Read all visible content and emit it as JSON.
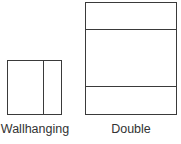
{
  "diagram": {
    "shapes": [
      {
        "id": "wallhanging",
        "label": "Wallhanging",
        "type": "rectangle",
        "dividers": "one vertical divider"
      },
      {
        "id": "double",
        "label": "Double",
        "type": "rectangle",
        "dividers": "two horizontal dividers"
      }
    ],
    "line_color": "#3a3a3a",
    "text_color": "#333333"
  }
}
